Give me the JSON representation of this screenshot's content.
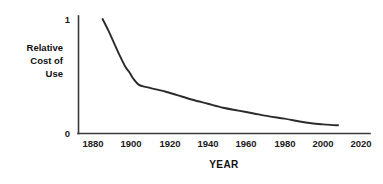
{
  "chart_data": {
    "type": "line",
    "title": "",
    "xlabel": "YEAR",
    "ylabel": "Relative Cost of Use",
    "ylabel_lines": [
      "Relative",
      "Cost of",
      "Use"
    ],
    "xlim": [
      1873,
      2025
    ],
    "ylim": [
      0,
      1.08
    ],
    "grid": false,
    "legend": null,
    "xticks": [
      1880,
      1900,
      1920,
      1940,
      1960,
      1980,
      2000,
      2020
    ],
    "xtick_labels": [
      "1880",
      "1900",
      "1920",
      "1940",
      "1960",
      "1980",
      "2000",
      "2020"
    ],
    "yticks": [
      0,
      1
    ],
    "ytick_labels": [
      "0",
      "1"
    ],
    "series": [
      {
        "name": "Relative Cost of Use",
        "color": "#2b2b2b",
        "x": [
          1885,
          1888,
          1891,
          1894,
          1897,
          1899,
          1901,
          1904,
          1908,
          1913,
          1918,
          1924,
          1932,
          1940,
          1948,
          1956,
          1964,
          1972,
          1980,
          1988,
          1994,
          2000,
          2004,
          2008
        ],
        "y": [
          1.0,
          0.9,
          0.79,
          0.68,
          0.58,
          0.535,
          0.48,
          0.425,
          0.405,
          0.385,
          0.365,
          0.335,
          0.295,
          0.26,
          0.225,
          0.2,
          0.175,
          0.15,
          0.13,
          0.105,
          0.09,
          0.08,
          0.075,
          0.072
        ]
      }
    ]
  },
  "axis_colors": {
    "axis": "#3a3a3a",
    "curve": "#2b2b2b",
    "text": "#111111",
    "background": "#ffffff"
  }
}
